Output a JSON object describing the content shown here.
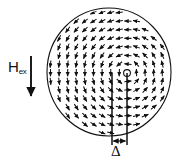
{
  "figure": {
    "type": "vector-field-diagram",
    "background_color": "#ffffff",
    "stroke_color": "#111111",
    "width": 180,
    "height": 165
  },
  "labels": {
    "external_field_symbol": "H",
    "external_field_subscript": "ex",
    "displacement_symbol": "Δ"
  },
  "disk": {
    "name": "nanodisk-outline",
    "center_x": 109,
    "center_y": 72,
    "radius_x": 62,
    "radius_y": 64,
    "stroke_width": 1.1
  },
  "vortex": {
    "name": "vortex-core",
    "core_x": 127,
    "core_y": 73,
    "core_radius": 3.4,
    "circulation": "counterclockwise",
    "chirality_note": "top arrows point right, right arrows point up, left arrows point down"
  },
  "field_arrow": {
    "name": "external-field-arrow",
    "x": 31,
    "y_top": 56,
    "y_bottom": 100,
    "direction": "down"
  },
  "displacement": {
    "name": "core-displacement-marker",
    "left_line_x": 112,
    "right_line_x": 127,
    "line_y_top": 73,
    "line_y_bottom": 145,
    "arrow_y": 141,
    "value_label": "Δ"
  },
  "vector_field": {
    "arrow_length": 7.2,
    "grid_spacing": 8.6,
    "head_size": 2.5,
    "rows": 16,
    "cols": 16
  }
}
